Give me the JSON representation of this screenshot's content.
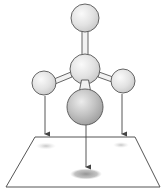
{
  "diagram": {
    "type": "molecular-projection",
    "colors": {
      "background": "#ffffff",
      "outline": "#555555",
      "atom_light": "#f4f4f4",
      "atom_mid": "#d2d2d2",
      "atom_dark_light": "#e6e6e6",
      "atom_dark_mid": "#a8a8a8",
      "bond_fill": "#f2f2f2",
      "shadow": "#9a9a9a",
      "arrow": "#444444"
    },
    "atoms": [
      {
        "id": "top",
        "cx": 85,
        "cy": 18,
        "r": 14,
        "shade": "light"
      },
      {
        "id": "center",
        "cx": 85,
        "cy": 69,
        "r": 15,
        "shade": "light"
      },
      {
        "id": "left",
        "cx": 44,
        "cy": 83,
        "r": 12,
        "shade": "light"
      },
      {
        "id": "right",
        "cx": 123,
        "cy": 81,
        "r": 12,
        "shade": "light"
      },
      {
        "id": "front",
        "cx": 85,
        "cy": 107,
        "r": 18,
        "shade": "dark"
      }
    ],
    "plane": {
      "corners": [
        [
          35,
          137
        ],
        [
          135,
          137
        ],
        [
          160,
          187
        ],
        [
          6,
          187
        ]
      ]
    },
    "projections": [
      {
        "from": "left",
        "x": 45,
        "y1": 96,
        "y2": 134,
        "shadow": {
          "cx": 46,
          "cy": 146,
          "rx": 10,
          "ry": 3.5
        }
      },
      {
        "from": "right",
        "x": 122,
        "y1": 94,
        "y2": 134,
        "shadow": {
          "cx": 121,
          "cy": 145,
          "rx": 8,
          "ry": 3
        }
      },
      {
        "from": "front",
        "x": 86,
        "y1": 125,
        "y2": 167,
        "shadow": {
          "cx": 86,
          "cy": 174,
          "rx": 15,
          "ry": 5
        }
      }
    ]
  }
}
